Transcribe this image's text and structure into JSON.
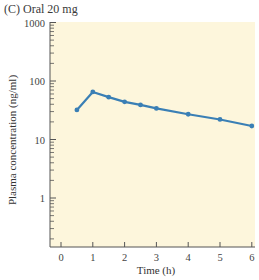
{
  "panel_title": "(C)  Oral 20 mg",
  "colors": {
    "plot_background": "#fdf6dc",
    "line": "#3a7fb5",
    "axis": "#555555"
  },
  "chart_data": {
    "type": "line",
    "title": "(C) Oral 20 mg",
    "xlabel": "Time (h)",
    "ylabel": "Plasma concentration (ng/ml)",
    "xlim": [
      -0.5,
      6
    ],
    "ylim": [
      0.15,
      1000
    ],
    "yscale": "log",
    "x_ticks": [
      "0",
      "1",
      "2",
      "3",
      "4",
      "5",
      "6"
    ],
    "y_ticks": [
      "1000",
      "100",
      "10",
      "1"
    ],
    "grid": false,
    "legend": null,
    "series": [
      {
        "name": "Oral 20 mg",
        "x": [
          0.5,
          1,
          1.5,
          2,
          2.5,
          3,
          4,
          5,
          6
        ],
        "values": [
          32,
          65,
          53,
          44,
          39,
          34,
          27,
          22,
          17
        ]
      }
    ]
  }
}
